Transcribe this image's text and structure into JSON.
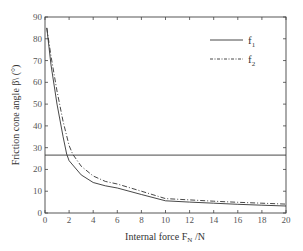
{
  "chart_data": {
    "type": "line",
    "title": "",
    "xlabel": "Internal force F_N /N",
    "ylabel": "Friction cone angle β\\ (°)",
    "xlim": [
      0,
      20
    ],
    "ylim": [
      0,
      90
    ],
    "xticks": [
      0,
      2,
      4,
      6,
      8,
      10,
      12,
      14,
      16,
      18,
      20
    ],
    "yticks": [
      0,
      10,
      20,
      30,
      40,
      50,
      60,
      70,
      80,
      90
    ],
    "grid": false,
    "legend_position": "upper right",
    "series": [
      {
        "name": "f1",
        "style": "solid",
        "x": [
          0.15,
          0.5,
          1.0,
          1.5,
          1.8,
          2.0,
          3.0,
          4.0,
          5.0,
          6.0,
          8.0,
          10.0,
          12.0,
          14.0,
          16.0,
          18.0,
          20.0
        ],
        "y": [
          85,
          68,
          50,
          35,
          27,
          24,
          17.5,
          14,
          12.5,
          11.5,
          8.5,
          5.6,
          5.0,
          4.5,
          4.0,
          3.6,
          3.2
        ]
      },
      {
        "name": "f2",
        "style": "dashdot",
        "x": [
          0.15,
          0.5,
          1.0,
          1.5,
          2.0,
          2.3,
          3.0,
          4.0,
          5.0,
          6.0,
          8.0,
          10.0,
          12.0,
          14.0,
          16.0,
          18.0,
          20.0
        ],
        "y": [
          85,
          72,
          56,
          42,
          31,
          27,
          21.5,
          17,
          14.5,
          13.3,
          10,
          6.6,
          6.0,
          5.4,
          4.9,
          4.5,
          4.1
        ]
      },
      {
        "name": "threshold",
        "style": "solid",
        "x": [
          0,
          20
        ],
        "y": [
          26.6,
          26.6
        ]
      }
    ]
  },
  "legend": {
    "items": [
      {
        "label": "f",
        "sub": "1",
        "style": "solid"
      },
      {
        "label": "f",
        "sub": "2",
        "style": "dashdot"
      }
    ]
  },
  "labels": {
    "xlabel_main": "Internal force F",
    "xlabel_sub": "N",
    "xlabel_unit": " /N",
    "ylabel": "Friction cone angle β\\ (°)"
  }
}
